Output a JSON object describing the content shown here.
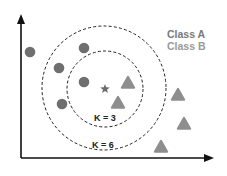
{
  "diagram": {
    "legend": [
      {
        "label": "Class A",
        "color": "#7a7a7a",
        "shape": "circle"
      },
      {
        "label": "Class B",
        "color": "#9a9a9a",
        "shape": "triangle"
      }
    ],
    "neighborhoods": [
      {
        "label": "K = 3",
        "cx": 105,
        "cy": 89,
        "r": 38
      },
      {
        "label": "K = 6",
        "cx": 104,
        "cy": 88,
        "r": 62
      }
    ],
    "query_point": {
      "shape": "star",
      "x": 105,
      "y": 89,
      "color": "#6b6b6b"
    },
    "class_a_points": [
      {
        "x": 30,
        "y": 52
      },
      {
        "x": 84,
        "y": 48
      },
      {
        "x": 59,
        "y": 68
      },
      {
        "x": 84,
        "y": 82
      },
      {
        "x": 62,
        "y": 104
      }
    ],
    "class_b_points": [
      {
        "x": 128,
        "y": 83
      },
      {
        "x": 118,
        "y": 103
      },
      {
        "x": 178,
        "y": 95
      },
      {
        "x": 184,
        "y": 124
      },
      {
        "x": 161,
        "y": 147
      }
    ],
    "colors": {
      "axis": "#111111",
      "class_a": "#6f6f6f",
      "class_b": "#8e8e8e",
      "dashed": "#222222",
      "label": "#222222"
    }
  }
}
